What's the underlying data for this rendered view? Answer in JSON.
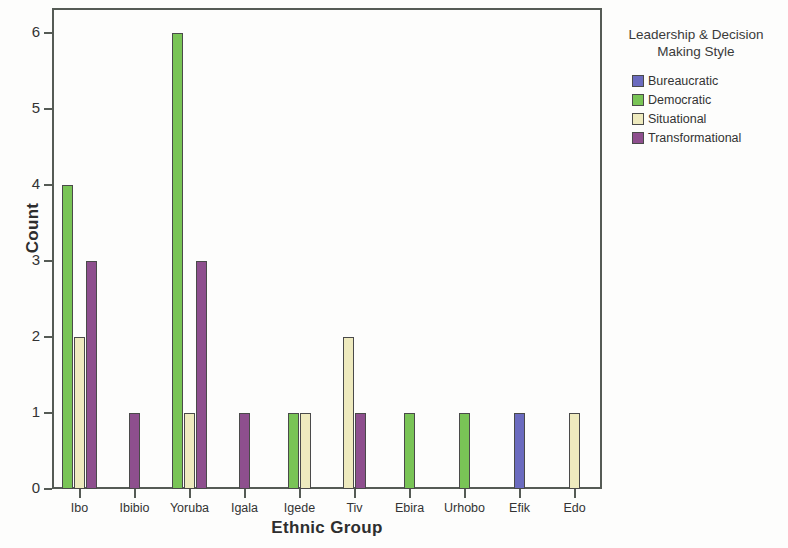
{
  "chart_data": {
    "type": "bar",
    "title": "",
    "xlabel": "Ethnic Group",
    "ylabel": "Count",
    "categories": [
      "Ibo",
      "Ibibio",
      "Yoruba",
      "Igala",
      "Igede",
      "Tiv",
      "Ebira",
      "Urhobo",
      "Efik",
      "Edo"
    ],
    "series": [
      {
        "name": "Bureaucratic",
        "color": "#6b6bbf",
        "values": [
          0,
          0,
          0,
          0,
          0,
          0,
          0,
          0,
          1,
          0
        ]
      },
      {
        "name": "Democratic",
        "color": "#79c456",
        "values": [
          4,
          0,
          6,
          0,
          1,
          0,
          1,
          1,
          0,
          0
        ]
      },
      {
        "name": "Situational",
        "color": "#eeeabe",
        "values": [
          2,
          0,
          1,
          0,
          1,
          2,
          0,
          0,
          0,
          1
        ]
      },
      {
        "name": "Transformational",
        "color": "#8e4f8e",
        "values": [
          3,
          1,
          3,
          1,
          0,
          1,
          0,
          0,
          0,
          0
        ]
      }
    ],
    "ylim": [
      0,
      6
    ],
    "yticks": [
      0,
      1,
      2,
      3,
      4,
      5,
      6
    ],
    "ytick_labels": [
      "0",
      "1",
      "2",
      "3",
      "4",
      "5",
      "6"
    ],
    "grid": false,
    "legend_position": "right",
    "legend_title": "Leadership & Decision Making Style",
    "legend_title_line1": "Leadership & Decision",
    "legend_title_line2": "Making Style"
  }
}
